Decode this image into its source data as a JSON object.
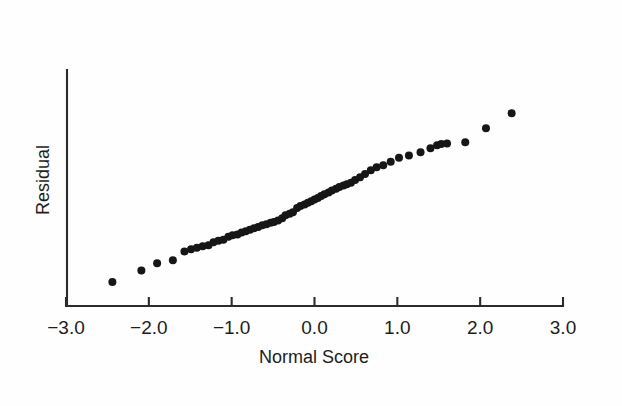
{
  "chart_data": {
    "type": "scatter",
    "title": "",
    "subtitle": "",
    "xlabel": "Normal Score",
    "ylabel": "Residual",
    "xlim": [
      -3.0,
      3.0
    ],
    "ylim": [
      -3.2,
      3.2
    ],
    "xticks": [
      -3.0,
      -2.0,
      -1.0,
      0.0,
      1.0,
      2.0,
      3.0
    ],
    "xticklabels": [
      "−3.0",
      "−2.0",
      "−1.0",
      "0.0",
      "1.0",
      "2.0",
      "3.0"
    ],
    "yticks": [],
    "yticklabels": [],
    "grid": false,
    "legend": null,
    "legend_position": "none",
    "marker_color": "#161616",
    "axis_color": "#2b2b2b",
    "background_color": "#fefefe",
    "marker_size_px": 8,
    "n_points": 61,
    "series": [
      {
        "name": "residuals",
        "x": [
          -2.44,
          -2.09,
          -1.9,
          -1.71,
          -1.57,
          -1.49,
          -1.42,
          -1.35,
          -1.28,
          -1.22,
          -1.16,
          -1.1,
          -1.04,
          -0.99,
          -0.93,
          -0.88,
          -0.83,
          -0.78,
          -0.73,
          -0.68,
          -0.63,
          -0.58,
          -0.53,
          -0.49,
          -0.44,
          -0.39,
          -0.35,
          -0.3,
          -0.26,
          -0.21,
          -0.17,
          -0.12,
          -0.08,
          -0.04,
          0.0,
          0.04,
          0.08,
          0.12,
          0.17,
          0.21,
          0.26,
          0.3,
          0.35,
          0.39,
          0.44,
          0.49,
          0.55,
          0.61,
          0.68,
          0.75,
          0.83,
          0.92,
          1.02,
          1.14,
          1.28,
          1.4,
          1.48,
          1.53,
          1.6,
          1.82,
          2.07,
          2.38
        ],
        "y": [
          -2.55,
          -2.24,
          -2.04,
          -1.96,
          -1.72,
          -1.66,
          -1.62,
          -1.58,
          -1.55,
          -1.47,
          -1.43,
          -1.4,
          -1.32,
          -1.28,
          -1.26,
          -1.21,
          -1.17,
          -1.13,
          -1.09,
          -1.06,
          -1.01,
          -0.98,
          -0.94,
          -0.92,
          -0.88,
          -0.82,
          -0.74,
          -0.7,
          -0.66,
          -0.54,
          -0.49,
          -0.45,
          -0.4,
          -0.36,
          -0.31,
          -0.27,
          -0.22,
          -0.17,
          -0.12,
          -0.07,
          -0.02,
          0.03,
          0.07,
          0.1,
          0.14,
          0.22,
          0.29,
          0.38,
          0.48,
          0.56,
          0.62,
          0.71,
          0.82,
          0.88,
          0.97,
          1.08,
          1.16,
          1.19,
          1.21,
          1.24,
          1.62,
          2.03
        ]
      }
    ]
  },
  "axes": {
    "x_axis_name": "normal-score-axis",
    "y_axis_name": "residual-axis"
  }
}
